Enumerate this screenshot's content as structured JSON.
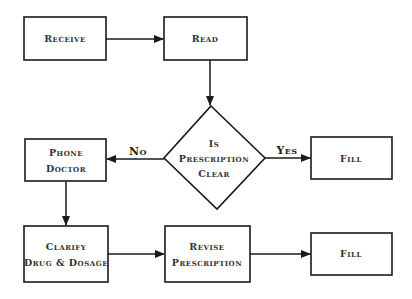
{
  "diagram": {
    "type": "flowchart",
    "nodes": {
      "receive": {
        "label": "Receive"
      },
      "read": {
        "label": "Read"
      },
      "decision": {
        "line1": "Is",
        "line2": "Prescription",
        "line3": "Clear"
      },
      "phone_doctor": {
        "line1": "Phone",
        "line2": "Doctor"
      },
      "fill_top": {
        "label": "Fill"
      },
      "clarify": {
        "line1": "Clarify",
        "line2": "Drug & Dosage"
      },
      "revise": {
        "line1": "Revise",
        "line2": "Prescription"
      },
      "fill_bottom": {
        "label": "Fill"
      }
    },
    "edges": {
      "no_label": "No",
      "yes_label": "Yes"
    },
    "connections": [
      {
        "from": "Receive",
        "to": "Read"
      },
      {
        "from": "Read",
        "to": "Is Prescription Clear"
      },
      {
        "from": "Is Prescription Clear",
        "to": "Phone Doctor",
        "label": "No"
      },
      {
        "from": "Is Prescription Clear",
        "to": "Fill",
        "label": "Yes"
      },
      {
        "from": "Phone Doctor",
        "to": "Clarify Drug & Dosage"
      },
      {
        "from": "Clarify Drug & Dosage",
        "to": "Revise Prescription"
      },
      {
        "from": "Revise Prescription",
        "to": "Fill"
      }
    ],
    "colors": {
      "stroke": "#1a1a1a",
      "text": "#333333",
      "background": "#ffffff"
    }
  }
}
